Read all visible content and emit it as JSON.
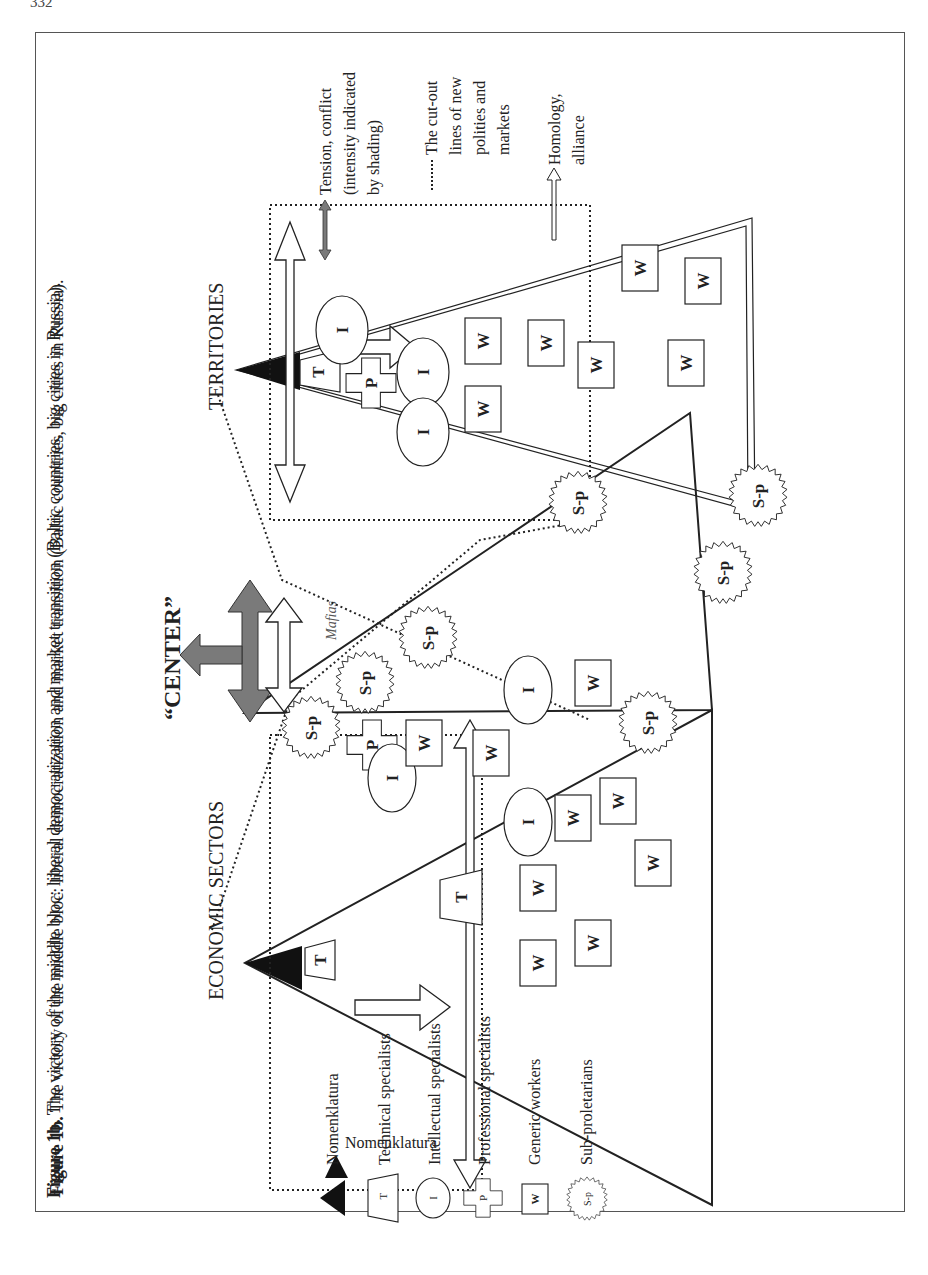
{
  "page": {
    "number": "332"
  },
  "caption": {
    "label": "Figure 1b.",
    "text": " The victory of the middle bloc: liberal democratization and market transition (Baltic countries, big cities in Russia)."
  },
  "diagram": {
    "pyramids": [
      {
        "id": "economic",
        "label": "ECONOMIC SECTORS"
      },
      {
        "id": "territories",
        "label": "TERRITORIES"
      }
    ],
    "center_label": "“CENTER”",
    "mafias_label": "Mafias",
    "shape_letters": {
      "T": "T",
      "I": "I",
      "P": "P",
      "W": "W",
      "Sp": "S-p"
    }
  },
  "legend_left": {
    "items": [
      {
        "icon": "nomenklatura-triangle-icon",
        "symbol": "",
        "label": "Nomenklatura"
      },
      {
        "icon": "technical-trapezoid-icon",
        "symbol": "T",
        "label": "Technical specialists"
      },
      {
        "icon": "intellectual-ellipse-icon",
        "symbol": "I",
        "label": "Intellectual specialists"
      },
      {
        "icon": "professional-cross-icon",
        "symbol": "P",
        "label": "Professional specialists"
      },
      {
        "icon": "generic-worker-box-icon",
        "symbol": "W",
        "label": "Generic workers"
      },
      {
        "icon": "sub-proletarian-star-icon",
        "symbol": "S-p",
        "label": "Sub-proletarians"
      }
    ]
  },
  "legend_right": {
    "items": [
      {
        "icon": "tension-arrow-icon",
        "lines": [
          "Tension, conflict",
          "(intensity indicated",
          "by shading)"
        ]
      },
      {
        "icon": "dotted-line-icon",
        "lines": [
          "The cut-out",
          "lines of new",
          "polities and",
          "markets"
        ]
      },
      {
        "icon": "alliance-arrow-icon",
        "lines": [
          "Homology,",
          "alliance"
        ]
      }
    ]
  },
  "colors": {
    "ink": "#222222",
    "tension_gray": "#7a7a7a",
    "frame": "#555555",
    "nomenklatura_fill": "#111111"
  }
}
